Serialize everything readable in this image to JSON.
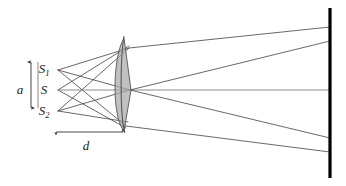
{
  "figure": {
    "kind": "optics-ray-diagram",
    "background_color": "#ffffff",
    "width": 346,
    "height": 186
  },
  "colors": {
    "ray_stroke": "#4d4d4d",
    "axis_ray_stroke": "#808080",
    "prism_fill": "#a9a9a9",
    "prism_stroke": "#555555",
    "screen_stroke": "#000000",
    "dim_stroke": "#333333",
    "label_fill": "#1a1a1a"
  },
  "labels": {
    "source_upper": {
      "base": "S",
      "sub": "1",
      "x": 44,
      "y": 73
    },
    "source_center": {
      "base": "S",
      "sub": "",
      "x": 44,
      "y": 93
    },
    "source_lower": {
      "base": "S",
      "sub": "2",
      "x": 44,
      "y": 113
    },
    "separation": {
      "base": "a",
      "sub": "",
      "x": 20,
      "y": 91
    },
    "distance": {
      "base": "d",
      "sub": "",
      "x": 85,
      "y": 149
    }
  },
  "elements": {
    "biprism": {
      "name": "biprism",
      "apex_x": 131,
      "top_y": 38,
      "bottom_y": 131,
      "center_y": 90,
      "left_x": 118,
      "bulge_x": 113
    },
    "screen": {
      "name": "observation-screen",
      "x": 330,
      "top_y": 8,
      "bottom_y": 178,
      "thickness": 3.2
    },
    "separation_arrow": {
      "name": "separation-dimension-a",
      "x": 31,
      "top_y": 60,
      "bottom_y": 110
    },
    "distance_arrow": {
      "name": "distance-dimension-d",
      "y": 132,
      "left_x": 55,
      "right_x": 124
    }
  },
  "source_points": [
    {
      "name": "S1",
      "x": 58,
      "y": 70
    },
    {
      "name": "S",
      "x": 58,
      "y": 90
    },
    {
      "name": "S2",
      "x": 58,
      "y": 111
    }
  ],
  "rays": [
    {
      "name": "ray-s1-upper",
      "x1": 58,
      "y1": 70,
      "x2": 129,
      "y2": 48
    },
    {
      "name": "ray-s1-mid",
      "x1": 58,
      "y1": 70,
      "x2": 130,
      "y2": 90
    },
    {
      "name": "ray-s1-lower",
      "x1": 58,
      "y1": 70,
      "x2": 126,
      "y2": 126
    },
    {
      "name": "ray-s-upper",
      "x1": 58,
      "y1": 90,
      "x2": 129,
      "y2": 46
    },
    {
      "name": "ray-s-axis",
      "x1": 58,
      "y1": 90,
      "x2": 330,
      "y2": 90
    },
    {
      "name": "ray-s-lower",
      "x1": 58,
      "y1": 90,
      "x2": 126,
      "y2": 128
    },
    {
      "name": "ray-s2-upper",
      "x1": 58,
      "y1": 111,
      "x2": 129,
      "y2": 48
    },
    {
      "name": "ray-s2-mid",
      "x1": 58,
      "y1": 111,
      "x2": 130,
      "y2": 90
    },
    {
      "name": "ray-s2-lower",
      "x1": 58,
      "y1": 111,
      "x2": 128,
      "y2": 122
    },
    {
      "name": "ray-out-top",
      "x1": 129,
      "y1": 48,
      "x2": 330,
      "y2": 27
    },
    {
      "name": "ray-out-upper",
      "x1": 130,
      "y1": 90,
      "x2": 330,
      "y2": 41
    },
    {
      "name": "ray-out-lower",
      "x1": 130,
      "y1": 90,
      "x2": 330,
      "y2": 138
    },
    {
      "name": "ray-out-bottom",
      "x1": 126,
      "y1": 126,
      "x2": 330,
      "y2": 152
    }
  ]
}
